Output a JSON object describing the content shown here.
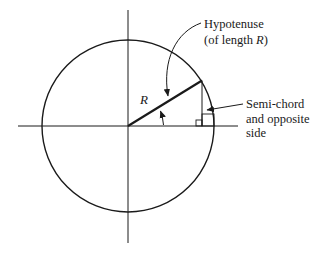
{
  "diagram": {
    "type": "circle-geometry",
    "colors": {
      "line": "#1a1a1a",
      "background": "#ffffff"
    },
    "labels": {
      "radius": "R",
      "hypotenuse_line1": "Hypotenuse",
      "hypotenuse_line2_prefix": "(of length ",
      "hypotenuse_line2_var": "R",
      "hypotenuse_line2_suffix": ")",
      "semichord_line1": "Semi-chord",
      "semichord_line2": "and opposite",
      "semichord_line3": "side"
    }
  }
}
